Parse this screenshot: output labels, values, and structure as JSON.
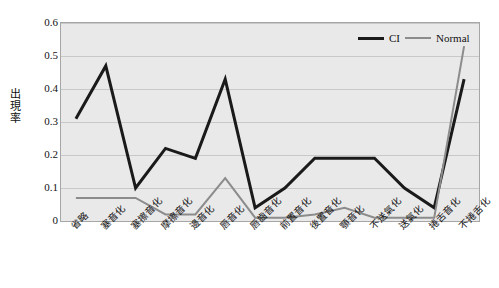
{
  "chart_data": {
    "type": "line",
    "title": "",
    "xlabel": "",
    "ylabel": "出現率",
    "ylim": [
      0,
      0.6
    ],
    "yticks": [
      "0.6",
      "0.5",
      "0.4",
      "0.3",
      "0.2",
      "0.1",
      "0"
    ],
    "ytick_values": [
      0.6,
      0.5,
      0.4,
      0.3,
      0.2,
      0.1,
      0
    ],
    "grid": true,
    "legend_position": "top-right",
    "categories": [
      "省略",
      "塞音化",
      "塞擦音化",
      "摩擦音化",
      "邊音化",
      "唇音化",
      "唇齒音化",
      "前置音化",
      "後置音化",
      "顎音化",
      "不送氣化",
      "送氣化",
      "捲舌音化",
      "不捲舌化"
    ],
    "series": [
      {
        "name": "CI",
        "color": "#1a1a1a",
        "width": 3,
        "values": [
          0.31,
          0.47,
          0.1,
          0.22,
          0.19,
          0.43,
          0.04,
          0.1,
          0.19,
          0.19,
          0.19,
          0.1,
          0.04,
          0.43
        ]
      },
      {
        "name": "Normal",
        "color": "#8c8c8c",
        "width": 2,
        "values": [
          0.07,
          0.07,
          0.07,
          0.02,
          0.02,
          0.13,
          0.01,
          0.01,
          0.02,
          0.04,
          0.01,
          0.01,
          0.01,
          0.53
        ]
      }
    ]
  },
  "legend": {
    "items": [
      {
        "label": "CI",
        "swatch": "line-black"
      },
      {
        "label": "Normal",
        "swatch": "line-gray"
      }
    ]
  },
  "colors": {
    "plot_background": "#e9e9e9",
    "grid": "#c8c8c8",
    "axis": "#a6a6a6",
    "series_ci": "#1a1a1a",
    "series_normal": "#8c8c8c",
    "text": "#111111"
  }
}
